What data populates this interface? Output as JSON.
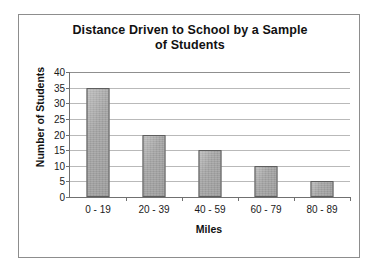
{
  "chart_data": {
    "type": "bar",
    "title": "Distance Driven to School by a Sample of Students",
    "title_line1": "Distance Driven to School by a Sample",
    "title_line2": "of Students",
    "xlabel": "Miles",
    "ylabel": "Number of Students",
    "categories": [
      "0 - 19",
      "20 - 39",
      "40 - 59",
      "60 - 79",
      "80 - 89"
    ],
    "values": [
      35,
      20,
      15,
      10,
      5
    ],
    "ylim": [
      0,
      40
    ],
    "ytick_step": 5,
    "yticks": [
      0,
      5,
      10,
      15,
      20,
      25,
      30,
      35,
      40
    ],
    "ytick_labels": [
      "0",
      "5",
      "10",
      "15",
      "20",
      "25",
      "30",
      "35",
      "40"
    ],
    "grid": true,
    "legend": false,
    "bar_color": "#a9a9a9",
    "bar_edge_color": "#5e5e5e",
    "grid_color": "#b9b9b9",
    "axis_color": "#707070",
    "frame_color": "#8d8d8d",
    "background_color": "#ffffff"
  }
}
